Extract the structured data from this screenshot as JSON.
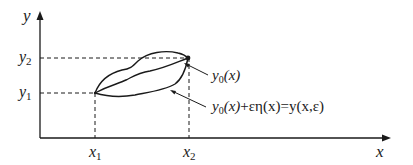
{
  "diagram": {
    "title": "",
    "axes": {
      "x_label": "x",
      "y_label": "y"
    },
    "ticks": {
      "x1": {
        "var": "x",
        "sub": "1"
      },
      "x2": {
        "var": "x",
        "sub": "2"
      },
      "y1": {
        "var": "y",
        "sub": "1"
      },
      "y2": {
        "var": "y",
        "sub": "2"
      }
    },
    "annotations": {
      "curve_label": {
        "var": "y",
        "sub": "0",
        "args": "(x)"
      },
      "varied_label": {
        "part1_var": "y",
        "part1_sub": "0",
        "part1_args": "(x)",
        "rest": "+εη(x)=y(x,ε)"
      }
    },
    "colors": {
      "stroke": "#1a1a1a",
      "background": "#ffffff"
    }
  }
}
